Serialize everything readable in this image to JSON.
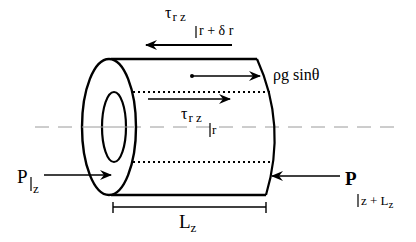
{
  "diagram": {
    "colors": {
      "stroke": "#000000",
      "axis": "#9a9a9a",
      "background": "#ffffff"
    },
    "labels": {
      "shear_outer": {
        "symbol": "τ",
        "subscript": "r z",
        "eval": "r + δ r"
      },
      "body_force": "ρg sinθ",
      "shear_inner": {
        "symbol": "τ",
        "subscript": "r z",
        "eval": "r"
      },
      "pressure_in": {
        "symbol": "P",
        "eval": "z"
      },
      "pressure_out": {
        "symbol": "P",
        "eval": "z + L",
        "eval_sub": "z"
      },
      "length": {
        "symbol": "L",
        "subscript": "z"
      }
    },
    "arrows": [
      {
        "name": "shear-outer-arrow",
        "direction": "left"
      },
      {
        "name": "body-force-arrow",
        "direction": "right"
      },
      {
        "name": "shear-inner-arrow",
        "direction": "right"
      },
      {
        "name": "pressure-in-arrow",
        "direction": "right"
      },
      {
        "name": "pressure-out-arrow",
        "direction": "left"
      }
    ]
  }
}
